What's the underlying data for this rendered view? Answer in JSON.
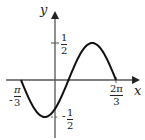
{
  "chart_data": {
    "type": "line",
    "title": "",
    "xlabel": "x",
    "ylabel": "y",
    "function": "y = (1/2) sin(2x - pi/3)",
    "x_domain": [
      "-pi/3",
      "2pi/3"
    ],
    "x_ticks": [
      {
        "label": "-π/3",
        "value": -1.0472,
        "num": "π",
        "den": "3",
        "sign": "-"
      },
      {
        "label": "2π/3",
        "value": 2.0944,
        "num": "2π",
        "den": "3",
        "sign": ""
      }
    ],
    "y_ticks": [
      {
        "label": "1/2",
        "value": 0.5,
        "num": "1",
        "den": "2",
        "sign": ""
      },
      {
        "label": "-1/2",
        "value": -0.5,
        "num": "1",
        "den": "2",
        "sign": "-"
      }
    ],
    "key_points": [
      {
        "x": -1.0472,
        "y": 0
      },
      {
        "x": -0.2618,
        "y": -0.5
      },
      {
        "x": 0.5236,
        "y": 0
      },
      {
        "x": 1.309,
        "y": 0.5
      },
      {
        "x": 2.0944,
        "y": 0
      }
    ],
    "ylim": [
      -0.75,
      0.75
    ],
    "grid": false,
    "colors": {
      "curve": "#111111",
      "axes": "#555555"
    }
  },
  "labels": {
    "x_axis": "x",
    "y_axis": "y",
    "tick_x_neg_sign": "-",
    "tick_x_neg_num": "π",
    "tick_x_neg_den": "3",
    "tick_x_pos_num": "2π",
    "tick_x_pos_den": "3",
    "tick_y_pos_num": "1",
    "tick_y_pos_den": "2",
    "tick_y_neg_sign": "-",
    "tick_y_neg_num": "1",
    "tick_y_neg_den": "2"
  }
}
